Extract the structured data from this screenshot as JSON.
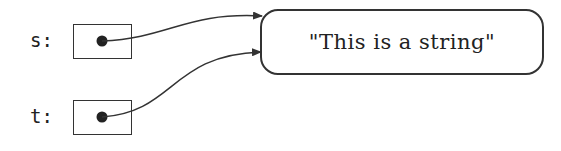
{
  "diagram": {
    "variables": [
      {
        "name": "s",
        "label": "s:"
      },
      {
        "name": "t",
        "label": "t:"
      }
    ],
    "string_object": {
      "value": "\"This is a string\""
    },
    "references": [
      {
        "from": "s",
        "to": "string_object"
      },
      {
        "from": "t",
        "to": "string_object"
      }
    ],
    "colors": {
      "stroke": "#333333",
      "text": "#222222",
      "background": "#ffffff"
    }
  }
}
